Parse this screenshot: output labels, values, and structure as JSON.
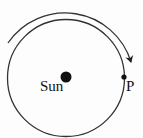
{
  "diagram": {
    "type": "orbit",
    "labels": {
      "sun": "Sun",
      "planet": "P"
    },
    "orbit": {
      "shape": "circle",
      "direction": "clockwise"
    },
    "colors": {
      "stroke": "#333333",
      "fill": "#111111",
      "background": "#fdfdfd"
    }
  }
}
